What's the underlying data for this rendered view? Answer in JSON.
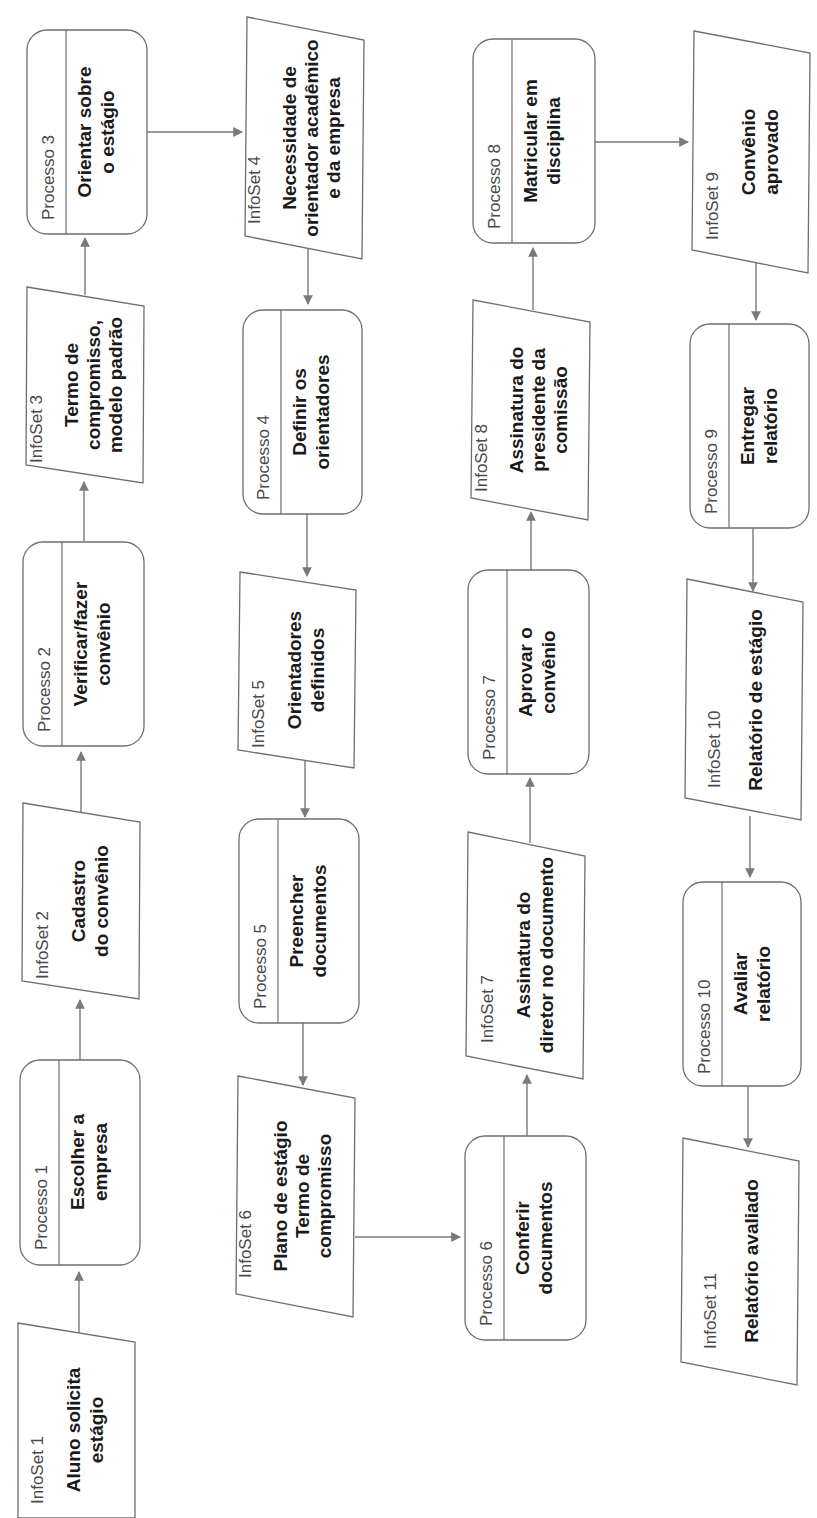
{
  "diagram": {
    "orientation": "rotated-90-ccw",
    "colors": {
      "stroke": "#6f6f6f",
      "arrow": "#7a7a7a",
      "tag_text": "#4a4a4a",
      "title_text": "#1a1a1a",
      "background": "#ffffff"
    },
    "nodes": [
      {
        "id": "infoset1",
        "type": "infoset",
        "tag": "InfoSet 1",
        "lines": [
          "Aluno solicita",
          "estágio"
        ]
      },
      {
        "id": "processo1",
        "type": "process",
        "tag": "Processo 1",
        "lines": [
          "Escolher a",
          "empresa"
        ]
      },
      {
        "id": "infoset2",
        "type": "infoset",
        "tag": "InfoSet 2",
        "lines": [
          "Cadastro",
          "do convênio"
        ]
      },
      {
        "id": "processo2",
        "type": "process",
        "tag": "Processo 2",
        "lines": [
          "Verificar/fazer",
          "convênio"
        ]
      },
      {
        "id": "infoset3",
        "type": "infoset",
        "tag": "InfoSet 3",
        "lines": [
          "Termo de",
          "compromisso,",
          "modelo padrão"
        ]
      },
      {
        "id": "processo3",
        "type": "process",
        "tag": "Processo 3",
        "lines": [
          "Orientar sobre",
          "o estágio"
        ]
      },
      {
        "id": "infoset4",
        "type": "infoset",
        "tag": "InfoSet 4",
        "lines": [
          "Necessidade de",
          "orientador acadêmico",
          "e da empresa"
        ]
      },
      {
        "id": "processo4",
        "type": "process",
        "tag": "Processo 4",
        "lines": [
          "Definir os",
          "orientadores"
        ]
      },
      {
        "id": "infoset5",
        "type": "infoset",
        "tag": "InfoSet 5",
        "lines": [
          "Orientadores",
          "definidos"
        ]
      },
      {
        "id": "processo5",
        "type": "process",
        "tag": "Processo 5",
        "lines": [
          "Preencher",
          "documentos"
        ]
      },
      {
        "id": "infoset6",
        "type": "infoset",
        "tag": "InfoSet 6",
        "lines": [
          "Plano de estágio",
          "Termo de",
          "compromisso"
        ]
      },
      {
        "id": "processo6",
        "type": "process",
        "tag": "Processo 6",
        "lines": [
          "Conferir",
          "documentos"
        ]
      },
      {
        "id": "infoset7",
        "type": "infoset",
        "tag": "InfoSet 7",
        "lines": [
          "Assinatura do",
          "diretor no documento"
        ]
      },
      {
        "id": "processo7",
        "type": "process",
        "tag": "Processo 7",
        "lines": [
          "Aprovar o",
          "convênio"
        ]
      },
      {
        "id": "infoset8",
        "type": "infoset",
        "tag": "InfoSet 8",
        "lines": [
          "Assinatura do",
          "presidente da",
          "comissão"
        ]
      },
      {
        "id": "processo8",
        "type": "process",
        "tag": "Processo 8",
        "lines": [
          "Matricular em",
          "disciplina"
        ]
      },
      {
        "id": "infoset9",
        "type": "infoset",
        "tag": "InfoSet 9",
        "lines": [
          "Convênio",
          "aprovado"
        ]
      },
      {
        "id": "processo9",
        "type": "process",
        "tag": "Processo 9",
        "lines": [
          "Entregar",
          "relatório"
        ]
      },
      {
        "id": "infoset10",
        "type": "infoset",
        "tag": "InfoSet 10",
        "lines": [
          "Relatório de estágio"
        ]
      },
      {
        "id": "processo10",
        "type": "process",
        "tag": "Processo 10",
        "lines": [
          "Avaliar",
          "relatório"
        ]
      },
      {
        "id": "infoset11",
        "type": "infoset",
        "tag": "InfoSet 11",
        "lines": [
          "Relatório avaliado"
        ]
      }
    ],
    "edges": [
      [
        "infoset1",
        "processo1"
      ],
      [
        "processo1",
        "infoset2"
      ],
      [
        "infoset2",
        "processo2"
      ],
      [
        "processo2",
        "infoset3"
      ],
      [
        "infoset3",
        "processo3"
      ],
      [
        "processo3",
        "infoset4"
      ],
      [
        "infoset4",
        "processo4"
      ],
      [
        "processo4",
        "infoset5"
      ],
      [
        "infoset5",
        "processo5"
      ],
      [
        "processo5",
        "infoset6"
      ],
      [
        "infoset6",
        "processo6"
      ],
      [
        "processo6",
        "infoset7"
      ],
      [
        "infoset7",
        "processo7"
      ],
      [
        "processo7",
        "infoset8"
      ],
      [
        "infoset8",
        "processo8"
      ],
      [
        "processo8",
        "infoset9"
      ],
      [
        "infoset9",
        "processo9"
      ],
      [
        "processo9",
        "infoset10"
      ],
      [
        "infoset10",
        "processo10"
      ],
      [
        "processo10",
        "infoset11"
      ]
    ]
  }
}
